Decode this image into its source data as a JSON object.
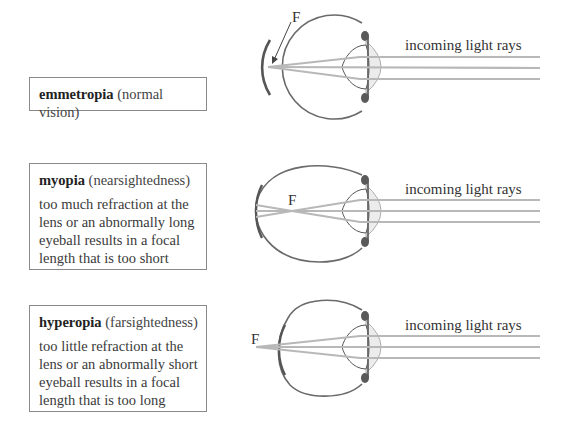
{
  "panels": [
    {
      "id": "emmetropia",
      "term": "emmetropia",
      "qualifier": "(normal vision)",
      "description": "",
      "focal_label": "F",
      "rays_label": "incoming light rays"
    },
    {
      "id": "myopia",
      "term": "myopia",
      "qualifier": "(nearsightedness)",
      "description_lines": [
        "too much refraction at the",
        "lens or an abnormally long",
        "eyeball results in a focal",
        "length that is too short"
      ],
      "focal_label": "F",
      "rays_label": "incoming light rays"
    },
    {
      "id": "hyperopia",
      "term": "hyperopia",
      "qualifier": "(farsightedness)",
      "description_lines": [
        "too little refraction at the",
        "lens or an abnormally short",
        "eyeball results in a focal",
        "length that is too long"
      ],
      "focal_label": "F",
      "rays_label": "incoming light rays"
    }
  ],
  "colors": {
    "eye_outline": "#6a6a6a",
    "rays": "#b8b8b8",
    "cornea_fill": "#ececec",
    "iris": "#5a5a5a",
    "text": "#333333"
  }
}
